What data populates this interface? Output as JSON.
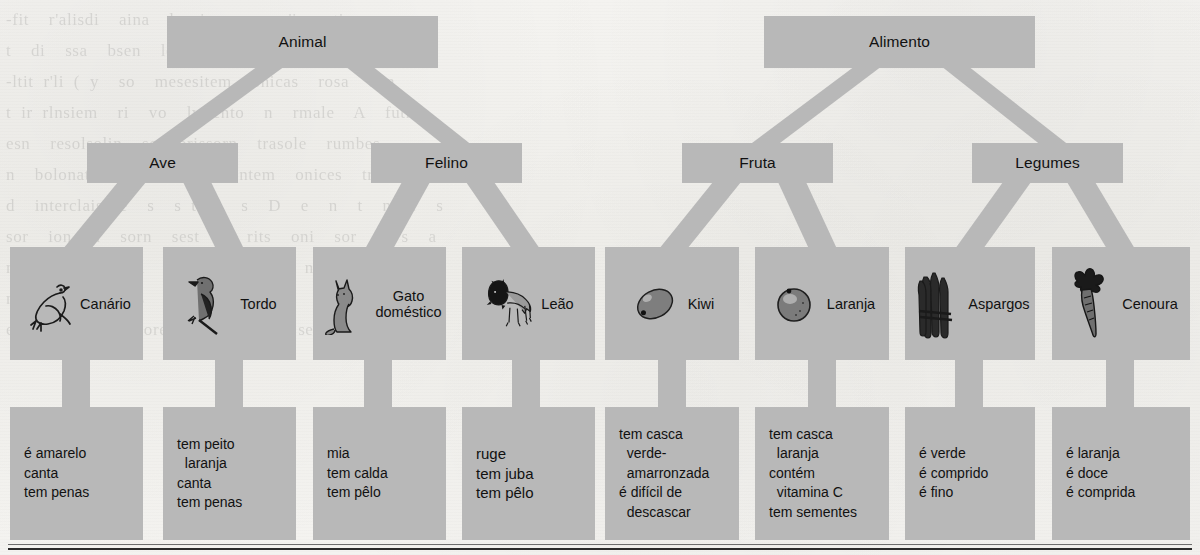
{
  "diagram": {
    "box_color": "#b8b8b8",
    "text_color": "#111111",
    "connector_color": "#b8b8b8",
    "background_color": "#f3f2ef"
  },
  "ghost_text": "-fit  r'alisdi  aina  lsonicm  se  r'is  nti-\nt  di  ssa  bsen  loraison  ainesa  nti sei ri\n-ltit r'li ( y  so  mesesitem  onicas  rosa  ann\nt ir rlnsiem  ri  vo  lvriento  n  rmale  A  futhc\nesn  resolsolin  so  brissorn  trasole  rumbes\nn  bolonatem  so  mrnt  contem  onices  trbe-\nd  interclaissoe  s  s t  l  s  D  e  n  t  n  l  s\nsor  ion  n  sorn  sest  e  rits  oni  sor  i  s  a\nn  r  nom  s  i  n  r  t  m  s  n  o  s  e  t\nmesirsosa  toi  s  r  rasona  s  e  o  n  rase\nenore  s  nol  soreste  n  tr  li  sesi  ore  e",
  "levels": {
    "category_top": [
      {
        "id": "animal",
        "label": "Animal"
      },
      {
        "id": "alimento",
        "label": "Alimento"
      }
    ],
    "category_mid": [
      {
        "id": "ave",
        "label": "Ave"
      },
      {
        "id": "felino",
        "label": "Felino"
      },
      {
        "id": "fruta",
        "label": "Fruta"
      },
      {
        "id": "legumes",
        "label": "Legumes"
      }
    ],
    "instances": [
      {
        "id": "canario",
        "label": "Canário",
        "icon": "canary-bird-icon"
      },
      {
        "id": "tordo",
        "label": "Tordo",
        "icon": "thrush-bird-icon"
      },
      {
        "id": "gato",
        "label": "Gato\ndoméstico",
        "icon": "domestic-cat-icon"
      },
      {
        "id": "leao",
        "label": "Leão",
        "icon": "lion-icon"
      },
      {
        "id": "kiwi",
        "label": "Kiwi",
        "icon": "kiwi-fruit-icon"
      },
      {
        "id": "laranja",
        "label": "Laranja",
        "icon": "orange-fruit-icon"
      },
      {
        "id": "aspargos",
        "label": "Aspargos",
        "icon": "asparagus-icon"
      },
      {
        "id": "cenoura",
        "label": "Cenoura",
        "icon": "carrot-icon"
      }
    ],
    "properties": [
      {
        "id": "prop-canario",
        "lines": [
          "é amarelo",
          "canta",
          "tem penas"
        ]
      },
      {
        "id": "prop-tordo",
        "lines": [
          "tem peito",
          "  laranja",
          "canta",
          "tem penas"
        ]
      },
      {
        "id": "prop-gato",
        "lines": [
          "mia",
          "tem calda",
          "tem pêlo"
        ]
      },
      {
        "id": "prop-leao",
        "lines": [
          "ruge",
          "tem juba",
          "tem pêlo"
        ]
      },
      {
        "id": "prop-kiwi",
        "lines": [
          "tem casca",
          "  verde-",
          "  amarronzada",
          "é difícil de",
          "  descascar"
        ]
      },
      {
        "id": "prop-laranja",
        "lines": [
          "tem casca",
          "  laranja",
          "contém",
          "  vitamina C",
          "tem sementes"
        ]
      },
      {
        "id": "prop-aspargos",
        "lines": [
          "é verde",
          "é comprido",
          "é fino"
        ]
      },
      {
        "id": "prop-cenoura",
        "lines": [
          "é laranja",
          "é doce",
          "é comprida"
        ]
      }
    ]
  }
}
